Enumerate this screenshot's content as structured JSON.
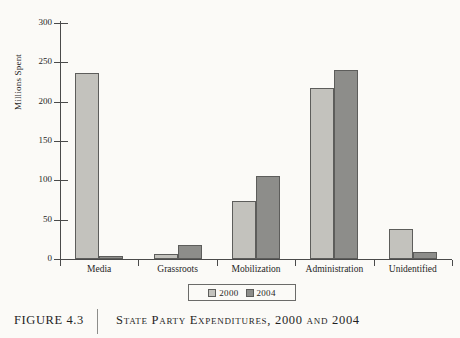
{
  "figure": {
    "number_label": "FIGURE 4.3",
    "title": "State Party Expenditures, 2000 and 2004"
  },
  "chart_data": {
    "type": "bar",
    "title": "State Party Expenditures, 2000 and 2004",
    "xlabel": "",
    "ylabel": "Millions Spent",
    "ylim": [
      0,
      300
    ],
    "yticks": [
      0,
      50,
      100,
      150,
      200,
      250,
      300
    ],
    "ytick_labels": [
      "0",
      "50",
      "100",
      "150",
      "200",
      "250",
      "300"
    ],
    "grid": false,
    "legend_position": "bottom-center",
    "categories": [
      "Media",
      "Grassroots",
      "Mobilization",
      "Administration",
      "Unidentified"
    ],
    "series": [
      {
        "name": "2000",
        "color": "#c3c2bd",
        "values": [
          236,
          7,
          74,
          218,
          38
        ]
      },
      {
        "name": "2004",
        "color": "#8d8d8a",
        "values": [
          4,
          18,
          105,
          240,
          9
        ]
      }
    ]
  },
  "colors": {
    "background": "#fbfaf7",
    "axis": "#4a4a4a",
    "bar_border": "#5d5d5b",
    "series_2000": "#c3c2bd",
    "series_2004": "#8d8d8a",
    "text": "#1f1f1f"
  }
}
